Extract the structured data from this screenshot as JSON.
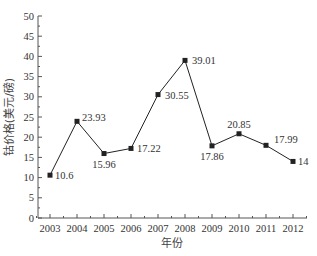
{
  "chart_data": {
    "type": "line",
    "title": "",
    "xlabel": "年份",
    "ylabel": "钴价格(美元/磅)",
    "categories": [
      "2003",
      "2004",
      "2005",
      "2006",
      "2007",
      "2008",
      "2009",
      "2010",
      "2011",
      "2012"
    ],
    "series": [
      {
        "name": "钴价格",
        "values": [
          10.6,
          23.93,
          15.96,
          17.22,
          30.55,
          39.01,
          17.86,
          20.85,
          17.99,
          14
        ],
        "labels": [
          "10.6",
          "23.93",
          "15.96",
          "17.22",
          "30.55",
          "39.01",
          "17.86",
          "20.85",
          "17.99",
          "14"
        ],
        "marker": "square",
        "color": "#222222"
      }
    ],
    "ylim": [
      0,
      50
    ],
    "yticks": [
      0,
      5,
      10,
      15,
      20,
      25,
      30,
      35,
      40,
      45,
      50
    ],
    "grid": false,
    "legend": null
  }
}
